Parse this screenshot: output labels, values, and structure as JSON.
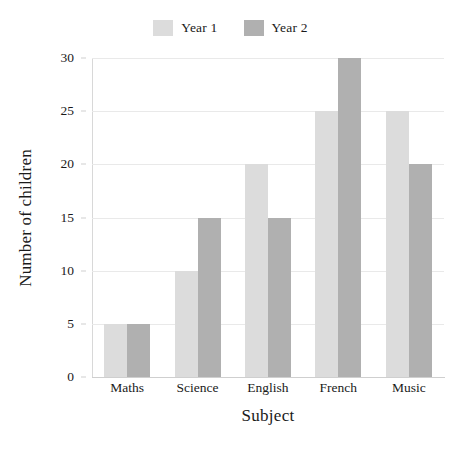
{
  "chart_data": {
    "type": "bar",
    "title": "",
    "xlabel": "Subject",
    "ylabel": "Number of children",
    "categories": [
      "Maths",
      "Science",
      "English",
      "French",
      "Music"
    ],
    "series": [
      {
        "name": "Year 1",
        "color": "#dcdcdc",
        "values": [
          5,
          10,
          20,
          25,
          25
        ]
      },
      {
        "name": "Year 2",
        "color": "#b0b0b0",
        "values": [
          5,
          15,
          15,
          30,
          20
        ]
      }
    ],
    "ylim": [
      0,
      30
    ],
    "ytick_labels": [
      "0",
      "5",
      "10",
      "15",
      "20",
      "25",
      "30"
    ],
    "ytick_values": [
      0,
      5,
      10,
      15,
      20,
      25,
      30
    ],
    "grid": "horizontal",
    "legend_position": "top-center",
    "gridline_color": "#e9e9e9",
    "axis_color": "#cfcfcf"
  }
}
